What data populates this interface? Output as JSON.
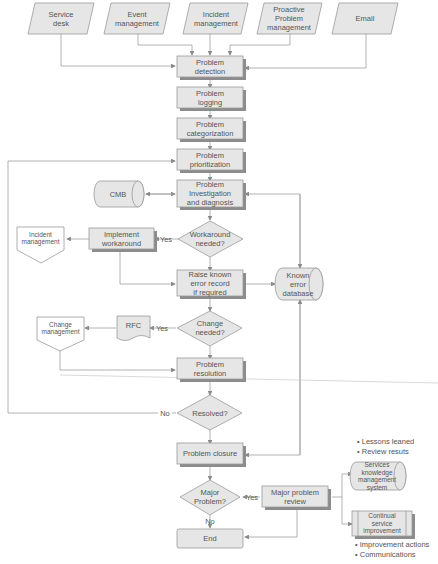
{
  "diagram": {
    "inputs": [
      {
        "id": "service-desk",
        "label": "Service\ndesk"
      },
      {
        "id": "event-management",
        "label": "Event\nmanagement"
      },
      {
        "id": "incident-management-input",
        "label": "Incident\nmanagement"
      },
      {
        "id": "proactive-problem-management",
        "label": "Proactive\nProblem\nmanagement"
      },
      {
        "id": "email",
        "label": "Email"
      }
    ],
    "steps": {
      "detection": "Problem\ndetection",
      "logging": "Problem\nlogging",
      "categorization": "Problem\ncategorization",
      "prioritization": "Problem\nprioritization",
      "investigation": "Problem\nInvestigation\nand diagnosis",
      "implement_workaround": "Implement\nworkaround",
      "raise_known_error": "Raise known\nerror record\nif required",
      "rfc": "RFC",
      "resolution": "Problem\nresolution",
      "closure": "Problem closure",
      "major_review": "Major problem\nreview",
      "end": "End"
    },
    "decisions": {
      "workaround_needed": "Workaround\nneeded?",
      "change_needed": "Change\nneeded?",
      "resolved": "Resolved?",
      "major_problem": "Major\nProblem?"
    },
    "edge_labels": {
      "yes_workaround": "Yes",
      "yes_change": "Yes",
      "no_resolved": "No",
      "yes_major": "Yes",
      "no_major": "No"
    },
    "stores": {
      "cmb": "CMB",
      "known_error_db": "Known\nerror\ndatabase",
      "skms": "Services\nknowledge\nmanagement\nsystem",
      "csi": "Continual\nservice\nimprovement"
    },
    "external": {
      "incident_management": "Incident\nmanagement",
      "change_management": "Change\nmanagement"
    },
    "notes": {
      "skms_bullets": "• Lessons leaned\n• Review resuts",
      "csi_bullets": "• Improvement actions\n• Communications"
    },
    "colors": {
      "box_fill": "#e6e6e6",
      "box_stroke": "#9a9a9a",
      "shadow": "#8c8c8c",
      "line": "#9a9a9a",
      "text": "#555555",
      "background": "#ffffff"
    }
  }
}
